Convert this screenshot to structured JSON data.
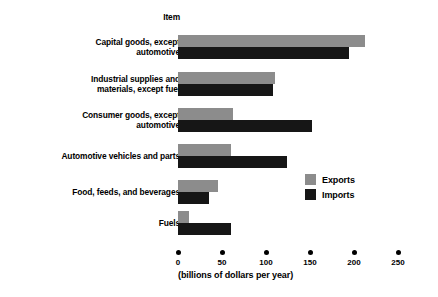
{
  "chart_data": {
    "type": "bar",
    "orientation": "horizontal",
    "title": "",
    "header_label": "Item",
    "xlabel": "(billions of dollars per year)",
    "ylabel": "",
    "xlim": [
      0,
      250
    ],
    "xticks": [
      0,
      50,
      100,
      150,
      200,
      250
    ],
    "xtick_labels": [
      "0",
      "50",
      "100",
      "150",
      "200",
      "250"
    ],
    "grid": false,
    "legend_position": "middle-right",
    "categories": [
      "Capital goods, except\nautomotive",
      "Industrial supplies and\nmaterials, except fuel",
      "Consumer goods, except\nautomotive",
      "Automotive vehicles and parts",
      "Food, feeds, and beverages",
      "Fuels"
    ],
    "series": [
      {
        "name": "Exports",
        "color": "#8c8c8c",
        "values": [
          212,
          110,
          62,
          60,
          45,
          13
        ]
      },
      {
        "name": "Imports",
        "color": "#161616",
        "values": [
          194,
          108,
          152,
          124,
          35,
          60
        ]
      }
    ]
  },
  "legend": {
    "items": [
      {
        "label": "Exports",
        "color": "#8c8c8c"
      },
      {
        "label": "Imports",
        "color": "#161616"
      }
    ]
  },
  "layout": {
    "row_tops": [
      35,
      72,
      108,
      144,
      180,
      211
    ],
    "bar_height": 12,
    "px_per_unit": 0.88,
    "origin_x": 178
  }
}
